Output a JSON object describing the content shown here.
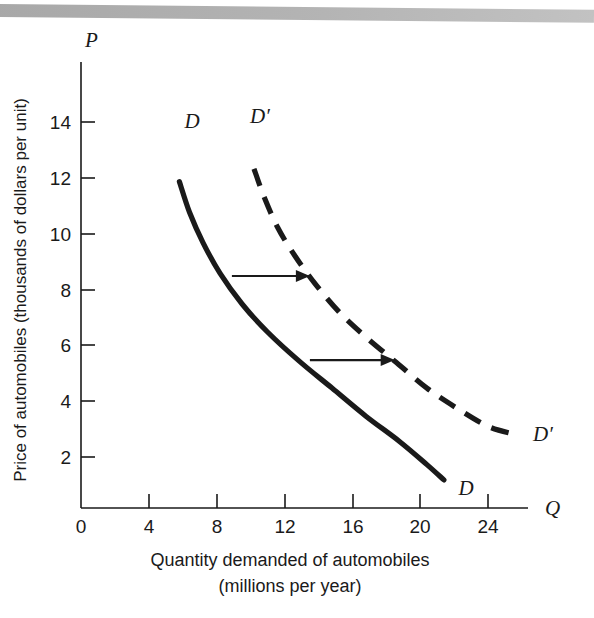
{
  "figure": {
    "background_color": "#ffffff",
    "ink_color": "#1a1a1a",
    "scan_bar_color": "#b0b0b0"
  },
  "chart_data": {
    "type": "line",
    "title": "",
    "xlabel": "Quantity demanded of automobiles",
    "xlabel_line2": "(millions per year)",
    "ylabel": "Price of automobiles (thousands of dollars per unit)",
    "x_axis_symbol": "Q",
    "y_axis_symbol": "P",
    "xlim": [
      0,
      26
    ],
    "ylim": [
      0,
      15
    ],
    "xticks": [
      0,
      4,
      8,
      12,
      16,
      20,
      24
    ],
    "xtick_labels": [
      "0",
      "4",
      "8",
      "12",
      "16",
      "20",
      "24"
    ],
    "yticks": [
      2,
      4,
      6,
      8,
      10,
      12,
      14
    ],
    "ytick_labels": [
      "2",
      "4",
      "6",
      "8",
      "10",
      "12",
      "14"
    ],
    "grid": false,
    "legend": "none",
    "series": [
      {
        "name": "D",
        "label": "D",
        "style": "solid",
        "color": "#1a1a1a",
        "label_start": "D",
        "label_end": "D",
        "points": [
          [
            5.8,
            12.8
          ],
          [
            6.4,
            11.6
          ],
          [
            7.2,
            10.4
          ],
          [
            8.2,
            9.2
          ],
          [
            9.5,
            8.0
          ],
          [
            11.0,
            6.9
          ],
          [
            12.8,
            5.8
          ],
          [
            14.8,
            4.7
          ],
          [
            16.8,
            3.6
          ],
          [
            18.8,
            2.6
          ],
          [
            20.4,
            1.7
          ],
          [
            21.4,
            1.1
          ]
        ]
      },
      {
        "name": "D-prime",
        "label": "D′",
        "style": "dashed",
        "color": "#1a1a1a",
        "label_start": "D′",
        "label_end": "D′",
        "points": [
          [
            10.2,
            13.3
          ],
          [
            10.8,
            12.2
          ],
          [
            11.6,
            11.0
          ],
          [
            12.6,
            9.9
          ],
          [
            13.8,
            8.8
          ],
          [
            15.2,
            7.7
          ],
          [
            16.8,
            6.7
          ],
          [
            18.6,
            5.7
          ],
          [
            20.4,
            4.7
          ],
          [
            22.2,
            3.9
          ],
          [
            24.0,
            3.2
          ],
          [
            25.5,
            2.9
          ]
        ]
      }
    ],
    "annotations": [
      {
        "name": "shift-arrow-upper",
        "type": "arrow",
        "x_start": 8.9,
        "x_end": 13.5,
        "y": 9.1
      },
      {
        "name": "shift-arrow-lower",
        "type": "arrow",
        "x_start": 13.5,
        "x_end": 18.5,
        "y": 5.8
      }
    ]
  }
}
